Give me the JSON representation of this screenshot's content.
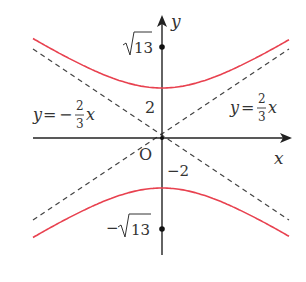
{
  "figure": {
    "type": "hyperbola-diagram",
    "equation": "y^2/4 - x^2/9 = 1",
    "colors": {
      "curve": "#e8414f",
      "axes": "#222222",
      "asymptote": "#444444",
      "text": "#333333"
    }
  },
  "axes": {
    "x_label": "x",
    "y_label": "y",
    "origin_label": "O"
  },
  "vertices": {
    "upper_label": "2",
    "lower_label": "−2"
  },
  "foci": {
    "upper_label": "13",
    "upper_prefix": "",
    "lower_label": "13",
    "lower_prefix": "−"
  },
  "asymptotes": [
    {
      "name": "negative",
      "lhs": "y",
      "eq": "=",
      "sign": "−",
      "num": "2",
      "den": "3",
      "var": "x"
    },
    {
      "name": "positive",
      "lhs": "y",
      "eq": "=",
      "sign": "",
      "num": "2",
      "den": "3",
      "var": "x"
    }
  ]
}
